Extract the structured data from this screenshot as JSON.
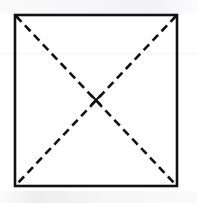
{
  "figure": {
    "background_color": "#ffffff",
    "stroke_color": "#111111",
    "canvas": {
      "width": 197,
      "height": 203
    }
  },
  "chart_data": {
    "type": "diagram",
    "shapes": [
      {
        "name": "square-outline",
        "kind": "rectangle",
        "style": "solid",
        "stroke_color": "#111111",
        "stroke_width": 2.6,
        "fill": "none",
        "corners": {
          "top_left": [
            15,
            15
          ],
          "top_right": [
            177,
            15
          ],
          "bottom_right": [
            177,
            186
          ],
          "bottom_left": [
            15,
            186
          ]
        }
      },
      {
        "name": "diagonal-top-left-to-bottom-right",
        "kind": "line",
        "style": "dashed",
        "stroke_color": "#111111",
        "stroke_width": 2.6,
        "dash_length": 8,
        "gap_length": 5,
        "from": [
          16,
          16
        ],
        "to": [
          176,
          185
        ]
      },
      {
        "name": "diagonal-top-right-to-bottom-left",
        "kind": "line",
        "style": "dashed",
        "stroke_color": "#111111",
        "stroke_width": 2.6,
        "dash_length": 8,
        "gap_length": 5,
        "from": [
          176,
          16
        ],
        "to": [
          16,
          185
        ]
      },
      {
        "name": "center-cross-mark",
        "kind": "x-mark",
        "style": "solid",
        "stroke_color": "#111111",
        "stroke_width": 2.2,
        "center": [
          96,
          100
        ],
        "size": 9
      }
    ],
    "annotations": [],
    "labels": [],
    "title": "",
    "legend": []
  }
}
